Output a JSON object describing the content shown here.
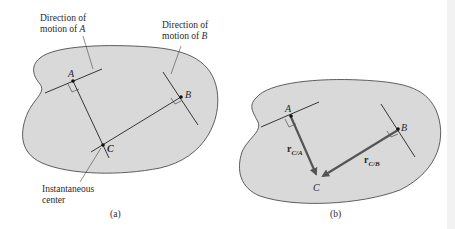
{
  "figure_a": {
    "caption": "(a)",
    "label_dir_a_line1": "Direction of",
    "label_dir_a_line2": "motion of ",
    "label_dir_a_var": "A",
    "label_dir_b_line1": "Direction of",
    "label_dir_b_line2": "motion of ",
    "label_dir_b_var": "B",
    "label_ic_line1": "Instantaneous",
    "label_ic_line2": "center",
    "point_a": "A",
    "point_b": "B",
    "point_c": "C"
  },
  "figure_b": {
    "caption": "(b)",
    "point_a": "A",
    "point_b": "B",
    "point_c": "C",
    "vector_ca": "r",
    "vector_ca_sub": "C/A",
    "vector_cb": "r",
    "vector_cb_sub": "C/B"
  },
  "colors": {
    "body_fill": "#d9d9d9",
    "outline": "#3a3a3a",
    "vector": "#555555",
    "right_edge_strip": "#f0f0f0"
  }
}
